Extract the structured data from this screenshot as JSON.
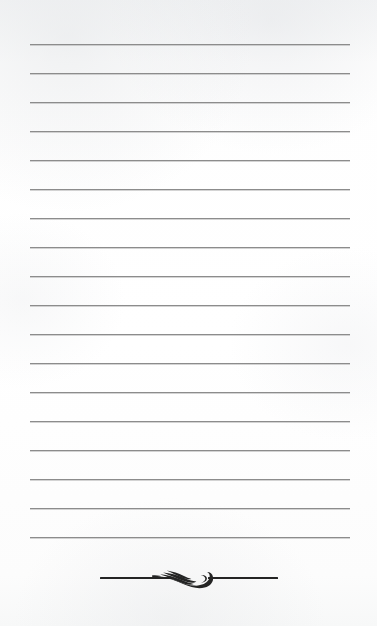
{
  "page": {
    "kind": "blank-ruled-notepaper",
    "width": 377,
    "height": 626,
    "background_color": "#fdfdfd",
    "top_margin": 44,
    "bottom_margin": 48
  },
  "rules": {
    "count": 18,
    "color": "#8c8c8c",
    "thickness": 1,
    "x_start": 30,
    "x_end": 350,
    "first_y": 44,
    "spacing": 29,
    "y_positions": [
      44,
      73,
      102,
      131,
      160,
      189,
      218,
      247,
      276,
      305,
      334,
      363,
      392,
      421,
      450,
      479,
      508,
      537
    ],
    "written_text": ""
  },
  "ornament": {
    "name": "leaf-flourish-divider",
    "color": "#242424",
    "center_y": 578,
    "x_start": 100,
    "x_end": 278,
    "rule_thickness": 2,
    "motif": "stylized-leaf-wing-scroll"
  }
}
